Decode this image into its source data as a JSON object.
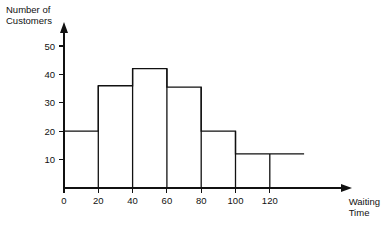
{
  "chart_data": {
    "type": "bar",
    "title": "",
    "subtitle": "",
    "xlabel": "Waiting Time",
    "ylabel": "Number of Customers",
    "xlim": [
      0,
      140
    ],
    "ylim": [
      0,
      55
    ],
    "grid": false,
    "legend": null,
    "xticks": [
      0,
      20,
      40,
      60,
      80,
      100,
      120
    ],
    "yticks": [
      10,
      20,
      30,
      40,
      50
    ],
    "xtick_labels": [
      "0",
      "20",
      "40",
      "60",
      "80",
      "100",
      "120"
    ],
    "ytick_labels": [
      "10",
      "20",
      "30",
      "40",
      "50"
    ],
    "bin_edges": [
      0,
      20,
      40,
      60,
      80,
      100,
      120,
      140
    ],
    "categories": [
      "0-20",
      "20-40",
      "40-60",
      "60-80",
      "80-100",
      "100-120",
      "120-140"
    ],
    "values": [
      20,
      36,
      42,
      35.5,
      20,
      12,
      12
    ],
    "bars": [
      {
        "label": "0-20",
        "start": 0,
        "end": 20,
        "value": 20
      },
      {
        "label": "20-40",
        "start": 20,
        "end": 40,
        "value": 36
      },
      {
        "label": "40-60",
        "start": 40,
        "end": 60,
        "value": 42
      },
      {
        "label": "60-80",
        "start": 60,
        "end": 80,
        "value": 35.5
      },
      {
        "label": "80-100",
        "start": 80,
        "end": 100,
        "value": 20
      },
      {
        "label": "100-120",
        "start": 100,
        "end": 120,
        "value": 12
      },
      {
        "label": "120-140",
        "start": 120,
        "end": 140,
        "value": 12
      }
    ],
    "annotations": []
  },
  "axes": {
    "y_title_lines": [
      "Number of",
      "Customers"
    ],
    "x_title_lines": [
      "Waiting",
      "Time"
    ],
    "y_arrow": true,
    "x_arrow": true
  },
  "colors": {
    "background": "#ffffff",
    "line": "#111111",
    "text": "#111111"
  }
}
